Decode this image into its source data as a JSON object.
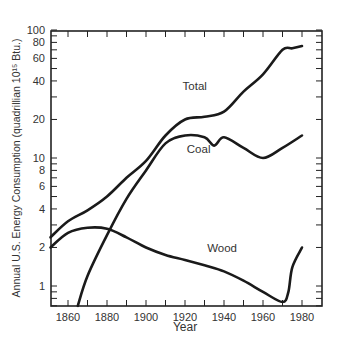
{
  "chart_data": {
    "type": "line",
    "title": "",
    "xlabel": "Year",
    "ylabel": "Annual U.S. Energy Consumption (quadrillian 10¹⁵ Btu.)",
    "yscale": "log",
    "xlim": [
      1851,
      1990
    ],
    "ylim": [
      0.7,
      100
    ],
    "x_ticks": [
      1860,
      1880,
      1900,
      1920,
      1940,
      1960,
      1980
    ],
    "y_ticks_labeled": [
      1,
      2,
      4,
      6,
      8,
      10,
      20,
      40,
      60,
      80,
      100
    ],
    "grid": false,
    "legend": "inline labels",
    "series": [
      {
        "name": "Total",
        "label_pos": [
          1925,
          34
        ],
        "points": [
          [
            1851,
            2.4
          ],
          [
            1860,
            3.2
          ],
          [
            1870,
            3.9
          ],
          [
            1880,
            5.0
          ],
          [
            1890,
            7.0
          ],
          [
            1900,
            9.5
          ],
          [
            1910,
            15
          ],
          [
            1920,
            20
          ],
          [
            1930,
            21
          ],
          [
            1940,
            23
          ],
          [
            1950,
            33
          ],
          [
            1960,
            45
          ],
          [
            1970,
            70
          ],
          [
            1975,
            72
          ],
          [
            1980,
            75
          ]
        ]
      },
      {
        "name": "Coal",
        "label_pos": [
          1927,
          11
        ],
        "points": [
          [
            1865,
            0.7
          ],
          [
            1870,
            1.2
          ],
          [
            1880,
            2.5
          ],
          [
            1890,
            4.8
          ],
          [
            1900,
            8.0
          ],
          [
            1910,
            13
          ],
          [
            1920,
            15
          ],
          [
            1930,
            14.5
          ],
          [
            1935,
            12.5
          ],
          [
            1940,
            14.5
          ],
          [
            1950,
            12
          ],
          [
            1960,
            10
          ],
          [
            1970,
            12
          ],
          [
            1980,
            15
          ]
        ]
      },
      {
        "name": "Wood",
        "label_pos": [
          1939,
          1.85
        ],
        "points": [
          [
            1851,
            2.0
          ],
          [
            1860,
            2.6
          ],
          [
            1870,
            2.85
          ],
          [
            1880,
            2.8
          ],
          [
            1890,
            2.4
          ],
          [
            1900,
            2.0
          ],
          [
            1910,
            1.75
          ],
          [
            1920,
            1.6
          ],
          [
            1930,
            1.45
          ],
          [
            1940,
            1.3
          ],
          [
            1950,
            1.1
          ],
          [
            1960,
            0.9
          ],
          [
            1970,
            0.75
          ],
          [
            1973,
            0.9
          ],
          [
            1975,
            1.4
          ],
          [
            1980,
            2.0
          ]
        ]
      }
    ]
  }
}
